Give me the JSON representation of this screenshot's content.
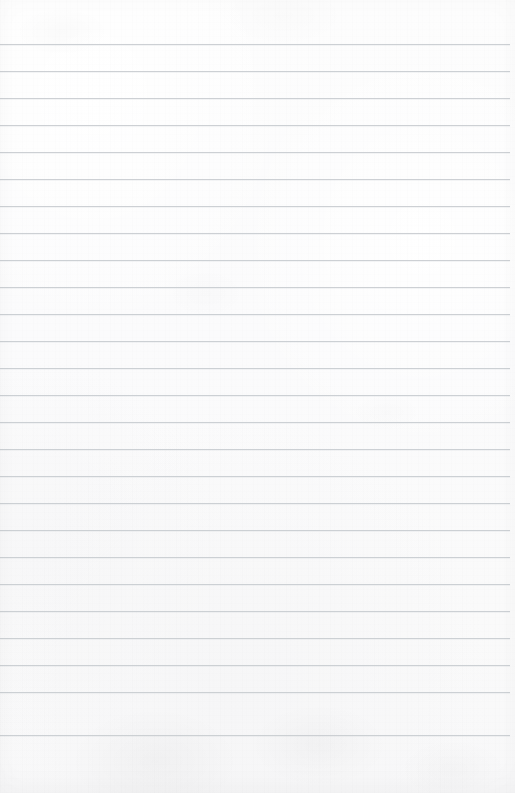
{
  "document": {
    "type": "lined-notebook-page",
    "title": "",
    "content_text": "",
    "is_blank": true,
    "page_width": 515,
    "page_height": 793
  },
  "paper": {
    "background_color": "#fcfcfc",
    "background_color_top": "#fdfdfd",
    "background_color_bottom": "#f8f8f9",
    "texture": "subtle paper grain",
    "margin_top": 44,
    "margin_bottom": 58,
    "margin_left": 0,
    "margin_right": 5
  },
  "ruling": {
    "line_color": "#c9cdd1",
    "line_thickness": 1,
    "line_spacing": 27,
    "first_line_y": 44,
    "last_line_y": 735,
    "line_start_x": 0,
    "line_end_x": 510,
    "line_count": 26,
    "lines": [
      {
        "index": 1,
        "y": 44,
        "x1": 0,
        "x2": 510
      },
      {
        "index": 2,
        "y": 71,
        "x1": 0,
        "x2": 510
      },
      {
        "index": 3,
        "y": 98,
        "x1": 0,
        "x2": 510
      },
      {
        "index": 4,
        "y": 125,
        "x1": 0,
        "x2": 510
      },
      {
        "index": 5,
        "y": 152,
        "x1": 0,
        "x2": 510
      },
      {
        "index": 6,
        "y": 179,
        "x1": 0,
        "x2": 510
      },
      {
        "index": 7,
        "y": 206,
        "x1": 0,
        "x2": 510
      },
      {
        "index": 8,
        "y": 233,
        "x1": 0,
        "x2": 510
      },
      {
        "index": 9,
        "y": 260,
        "x1": 0,
        "x2": 510
      },
      {
        "index": 10,
        "y": 287,
        "x1": 0,
        "x2": 510
      },
      {
        "index": 11,
        "y": 314,
        "x1": 0,
        "x2": 510
      },
      {
        "index": 12,
        "y": 341,
        "x1": 0,
        "x2": 510
      },
      {
        "index": 13,
        "y": 368,
        "x1": 0,
        "x2": 510
      },
      {
        "index": 14,
        "y": 395,
        "x1": 0,
        "x2": 510
      },
      {
        "index": 15,
        "y": 422,
        "x1": 0,
        "x2": 510
      },
      {
        "index": 16,
        "y": 449,
        "x1": 0,
        "x2": 510
      },
      {
        "index": 17,
        "y": 476,
        "x1": 0,
        "x2": 510
      },
      {
        "index": 18,
        "y": 503,
        "x1": 0,
        "x2": 510
      },
      {
        "index": 19,
        "y": 530,
        "x1": 0,
        "x2": 510
      },
      {
        "index": 20,
        "y": 557,
        "x1": 0,
        "x2": 510
      },
      {
        "index": 21,
        "y": 584,
        "x1": 0,
        "x2": 510
      },
      {
        "index": 22,
        "y": 611,
        "x1": 0,
        "x2": 510
      },
      {
        "index": 23,
        "y": 638,
        "x1": 0,
        "x2": 510
      },
      {
        "index": 24,
        "y": 665,
        "x1": 0,
        "x2": 510
      },
      {
        "index": 25,
        "y": 692,
        "x1": 0,
        "x2": 510
      },
      {
        "index": 26,
        "y": 735,
        "x1": 0,
        "x2": 510
      }
    ]
  }
}
